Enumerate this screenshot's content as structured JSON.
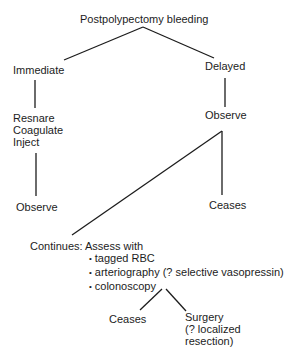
{
  "diagram": {
    "title": "Postpolypectomy bleeding",
    "immediate": {
      "label": "Immediate",
      "actions": [
        "Resnare",
        "Coagulate",
        "Inject"
      ],
      "next": "Observe"
    },
    "delayed": {
      "label": "Delayed",
      "next": "Observe",
      "outcome_ceases": "Ceases",
      "outcome_continues": {
        "label": "Continues: Assess with",
        "assessments": [
          "tagged RBC",
          "arteriography (? selective vasopressin)",
          "colonoscopy"
        ],
        "outcome_ceases": "Ceases",
        "outcome_surgery": [
          "Surgery",
          "(? localized",
          "resection)"
        ]
      }
    },
    "colors": {
      "text": "#1c1c1c",
      "line": "#1c1c1c",
      "background": "#ffffff"
    }
  }
}
